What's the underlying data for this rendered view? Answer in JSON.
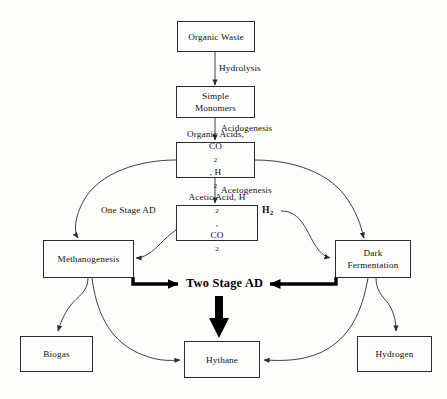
{
  "diagram": {
    "stroke_color": "#2b2b2b",
    "thick_stroke_color": "#000000",
    "background_color": "#fdfdfc"
  },
  "nodes": {
    "organic_waste": {
      "label": "Organic Waste"
    },
    "simple_monomers": {
      "line1": "Simple",
      "line2": "Monomers"
    },
    "organic_acids": {
      "line1": "Organic Acids,",
      "line2_pre": "CO",
      "line2_sub1": "2",
      "line2_mid": ", H",
      "line2_sub2": "2"
    },
    "acetic_acid": {
      "line1_pre": "Acetic Acid, H",
      "line1_sub": "2",
      "line1_post": ",",
      "line2_pre": "CO",
      "line2_sub": "2"
    },
    "methanogenesis": {
      "label": "Methanogenesis"
    },
    "dark_fermentation": {
      "line1": "Dark",
      "line2": "Fermentation"
    },
    "biogas": {
      "label": "Biogas"
    },
    "hythane": {
      "label": "Hythane"
    },
    "hydrogen": {
      "label": "Hydrogen"
    }
  },
  "edge_labels": {
    "hydrolysis": "Hydrolysis",
    "acidogenesis": "Acidogenesis",
    "acetogenesis": "Acetogenesis",
    "one_stage_ad": "One Stage AD",
    "h2_pre": "H",
    "h2_sub": "2"
  },
  "callouts": {
    "two_stage_ad": "Two Stage AD"
  }
}
